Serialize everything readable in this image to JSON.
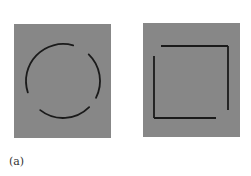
{
  "figure": {
    "caption_label": "(a)",
    "colors": {
      "panel_background": "#878787",
      "stroke": "#1a1a1a",
      "page_background": "#ffffff"
    },
    "panels": [
      {
        "id": "incomplete-circle",
        "shape": "circle",
        "description": "Circle drawn as three arcs with gaps (closure illustration)",
        "rect": {
          "x": 14,
          "y": 24,
          "width": 97,
          "height": 114
        },
        "center": {
          "x": 63,
          "y": 81
        },
        "radius": 37,
        "arcs_deg": [
          [
            162,
            286
          ],
          [
            314,
            387
          ],
          [
            45,
            128
          ]
        ]
      },
      {
        "id": "incomplete-square",
        "shape": "square",
        "description": "Square drawn as separated segments with gaps at corners (closure illustration)",
        "rect": {
          "x": 143,
          "y": 23,
          "width": 97,
          "height": 114
        },
        "segments": [
          {
            "x1": 161,
            "y1": 46,
            "x2": 228,
            "y2": 46
          },
          {
            "x1": 228,
            "y1": 46,
            "x2": 228,
            "y2": 110
          },
          {
            "x1": 154,
            "y1": 56,
            "x2": 154,
            "y2": 118
          },
          {
            "x1": 154,
            "y1": 118,
            "x2": 216,
            "y2": 118
          }
        ]
      }
    ]
  }
}
